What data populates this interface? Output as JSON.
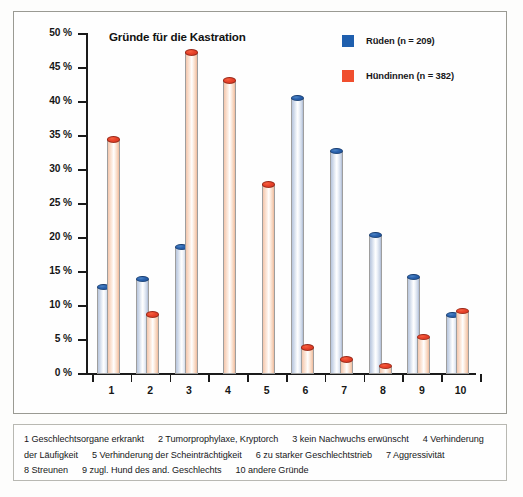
{
  "chart_data": {
    "type": "bar",
    "title": "Gründe für die Kastration",
    "xlabel": "",
    "ylabel": "",
    "ylim": [
      0,
      50
    ],
    "ytick_labels": [
      "0 %",
      "5 %",
      "10 %",
      "15 %",
      "20 %",
      "25 %",
      "30 %",
      "35 %",
      "40 %",
      "45 %",
      "50 %"
    ],
    "ytick_values": [
      0,
      5,
      10,
      15,
      20,
      25,
      30,
      35,
      40,
      45,
      50
    ],
    "grid": false,
    "legend_position": "top-right",
    "categories": [
      "1",
      "2",
      "3",
      "4",
      "5",
      "6",
      "7",
      "8",
      "9",
      "10"
    ],
    "series": [
      {
        "name": "Rüden (n = 209)",
        "color": "#1f5fae",
        "values": [
          12.8,
          14.0,
          18.7,
          0.0,
          0.0,
          40.6,
          32.8,
          20.5,
          14.3,
          8.7
        ]
      },
      {
        "name": "Hündinnen (n = 382)",
        "color": "#f04e2e",
        "values": [
          34.5,
          8.8,
          47.3,
          43.2,
          27.9,
          3.9,
          2.2,
          1.2,
          5.5,
          9.3
        ]
      }
    ]
  },
  "legend": {
    "items": [
      {
        "label": "Rüden (n = 209)",
        "color": "#1f5fae"
      },
      {
        "label": "Hündinnen (n = 382)",
        "color": "#f04e2e"
      }
    ]
  },
  "caption": {
    "line1_a": "1 Geschlechtsorgane erkrankt",
    "line1_b": "2 Tumorprophylaxe, Kryptorch",
    "line1_c": "3 kein Nachwuchs erwünscht",
    "line1_d": "4 Verhinderung",
    "line2_a": "der Läufigkeit",
    "line2_b": "5 Verhinderung der Scheinträchtigkeit",
    "line2_c": "6 zu starker Geschlechtstrieb",
    "line2_d": "7 Aggressivität",
    "line3_a": "8 Streunen",
    "line3_b": "9 zugl. Hund des and. Geschlechts",
    "line3_c": "10 andere Gründe"
  }
}
